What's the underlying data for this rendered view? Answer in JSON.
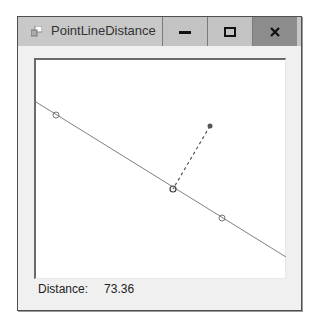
{
  "window": {
    "title": "PointLineDistance",
    "icon": "app-window-icon",
    "controls": {
      "minimize": "minimize-icon",
      "maximize": "maximize-icon",
      "close": "close-icon"
    }
  },
  "canvas": {
    "line": {
      "x1": 0,
      "y1": 42,
      "x2": 250,
      "y2": 197
    },
    "line_points": [
      {
        "x": 20,
        "y": 55
      },
      {
        "x": 186,
        "y": 158
      }
    ],
    "test_point": {
      "x": 174,
      "y": 66
    },
    "closest_point": {
      "x": 137,
      "y": 129
    },
    "colors": {
      "line": "#808080",
      "dashed": "#555555",
      "point": "#555555"
    }
  },
  "status": {
    "label": "Distance:",
    "value": "73.36"
  }
}
